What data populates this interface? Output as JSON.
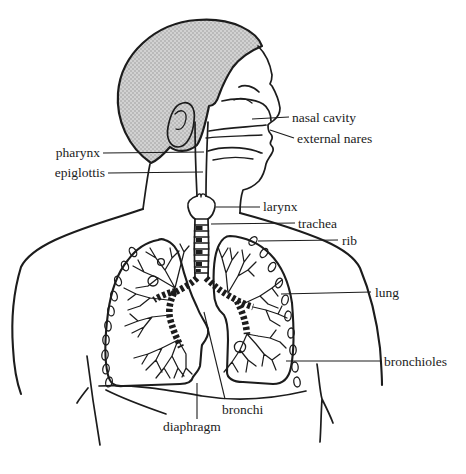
{
  "diagram": {
    "labels": {
      "nasal_cavity": "nasal cavity",
      "external_nares": "external nares",
      "pharynx": "pharynx",
      "epiglottis": "epiglottis",
      "larynx": "larynx",
      "trachea": "trachea",
      "rib": "rib",
      "lung": "lung",
      "bronchioles": "bronchioles",
      "bronchi": "bronchi",
      "diaphragm": "diaphragm"
    },
    "colors": {
      "ink": "#1c1c1c",
      "hair_gray": "#d2d2d2",
      "hair_dot": "#8f8f8f",
      "background": "#ffffff"
    }
  }
}
